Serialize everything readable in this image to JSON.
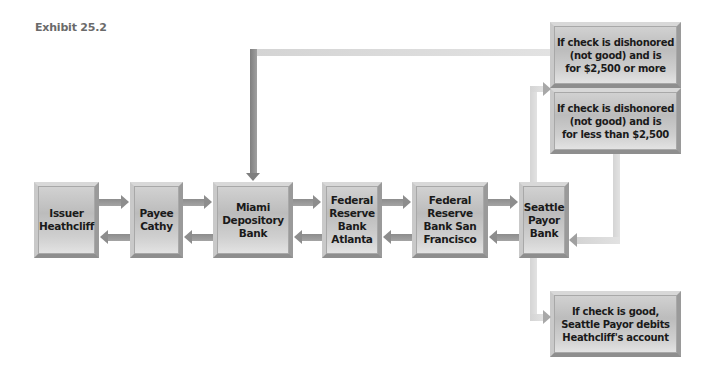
{
  "exhibit": {
    "title": "Exhibit 25.2"
  },
  "nodes": {
    "issuer": "Issuer\nHeathcliff",
    "payee": "Payee\nCathy",
    "miami": "Miami\nDepository\nBank",
    "fed_atlanta": "Federal\nReserve\nBank\nAtlanta",
    "fed_sf": "Federal\nReserve\nBank San\nFrancisco",
    "seattle": "Seattle\nPayor\nBank"
  },
  "outcomes": {
    "dishonored_large": "If check is dishonored\n(not good) and is\nfor $2,500 or more",
    "dishonored_small": "If check is dishonored\n(not good) and is\nfor less than $2,500",
    "good": "If check is good,\nSeattle Payor debits\nHeathcliff's account"
  },
  "colors": {
    "box_fill": "#c4c4c4",
    "arrow": "#8d8d8d",
    "connector_light": "#d6d6d6",
    "title": "#6a6a6a",
    "text": "#1a1a1a"
  }
}
